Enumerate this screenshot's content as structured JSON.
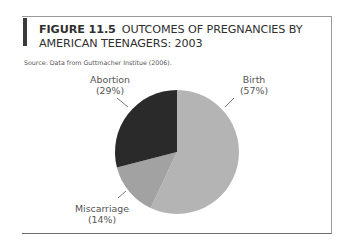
{
  "figure": {
    "number": "FIGURE 11.5",
    "title_line1": "OUTCOMES OF PREGNANCIES BY",
    "title_line2": "AMERICAN TEENAGERS: 2003",
    "source": "Source: Data from Guttmacher Institue (2006)."
  },
  "labels": {
    "birth": {
      "name": "Birth",
      "pct": "(57%)"
    },
    "abortion": {
      "name": "Abortion",
      "pct": "(29%)"
    },
    "miscarriage": {
      "name": "Miscarriage",
      "pct": "(14%)"
    }
  },
  "colors": {
    "birth": "#b4b4b4",
    "miscarriage": "#a2a2a2",
    "abortion": "#2a2a2a"
  },
  "chart_data": {
    "type": "pie",
    "source": "Source: Data from Guttmacher Institue (2006).",
    "categories": [
      "Birth",
      "Miscarriage",
      "Abortion"
    ],
    "values": [
      57,
      14,
      29
    ],
    "unit": "%",
    "start_angle": "12 o'clock, clockwise",
    "legend": "none (direct labels with leader lines)"
  }
}
